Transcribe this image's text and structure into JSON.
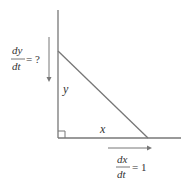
{
  "diagram": {
    "type": "related-rates-right-triangle",
    "legs": {
      "vertical": {
        "label": "y"
      },
      "horizontal": {
        "label": "x"
      }
    },
    "rates": {
      "dy_dt": {
        "numerator": "dy",
        "denominator": "dt",
        "equals": "= ?",
        "direction": "down"
      },
      "dx_dt": {
        "numerator": "dx",
        "denominator": "dt",
        "equals": "= 1",
        "direction": "right"
      }
    },
    "right_angle_marker": true,
    "colors": {
      "line": "#666666",
      "text": "#333333",
      "background": "#ffffff"
    }
  }
}
